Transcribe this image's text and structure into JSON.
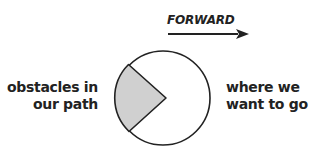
{
  "diagram": {
    "direction_label": "FORWARD",
    "left_label": [
      "obstacles in",
      "our path"
    ],
    "right_label": [
      "where we",
      "want to go"
    ],
    "colors": {
      "stroke": "#222222",
      "wedge_fill": "#d0d0d0",
      "circle_fill": "#ffffff",
      "text": "#222222"
    },
    "shapes": {
      "circle": {
        "cx": 163,
        "cy": 98,
        "r": 47
      },
      "wedge": {
        "apex": [
          166,
          98
        ],
        "start": [
          128,
          65
        ],
        "end": [
          129,
          132
        ]
      },
      "arrow": {
        "x1": 168,
        "y1": 34,
        "x2": 248,
        "y2": 34
      }
    }
  }
}
